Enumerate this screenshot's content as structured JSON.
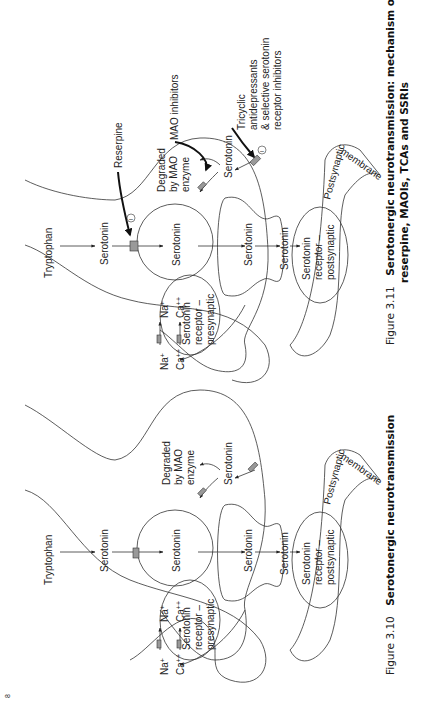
{
  "page": {
    "orientation": "rotated-90-ccw",
    "page_number_fragment": "8"
  },
  "figures": [
    {
      "id": "fig-3-10",
      "caption_number": "Figure 3.10",
      "caption_title": "Serotonergic neurotransmission",
      "labels": {
        "tryptophan": "Tryptophan",
        "serotonin_presynaptic": "Serotonin",
        "serotonin_vesicle": "Serotonin",
        "degraded_1": "Degraded",
        "degraded_2": "by MAO",
        "degraded_3": "enzyme",
        "serotonin_reuptake": "Serotonin",
        "serotonin_release": "Serotonin",
        "serotonin_cleft": "Serotonin",
        "na_out": "Na",
        "na_in": "Na",
        "ca_out": "Ca",
        "ca_in": "Ca",
        "na_charge": "+",
        "ca_charge": "++",
        "pre_receptor_1": "Serotonin",
        "pre_receptor_2": "receptor –",
        "pre_receptor_3": "presynaptic",
        "post_receptor_1": "Serotonin",
        "post_receptor_2": "receptor –",
        "post_receptor_3": "postsynaptic",
        "postsynaptic": "Postsynaptic",
        "membrane": "membrane"
      }
    },
    {
      "id": "fig-3-11",
      "caption_number": "Figure 3.11",
      "caption_title_line1": "Serotonergic neurotransmission: mechanism of action of",
      "caption_title_line2": "reserpine, MAOIs, TCAs and SSRIs",
      "labels": {
        "tryptophan": "Tryptophan",
        "serotonin_presynaptic": "Serotonin",
        "serotonin_vesicle": "Serotonin",
        "reserpine": "Reserpine",
        "mao_inhibitors": "MAO inhibitors",
        "degraded_1": "Degraded",
        "degraded_2": "by MAO",
        "degraded_3": "enzyme",
        "serotonin_reuptake": "Serotonin",
        "serotonin_release": "Serotonin",
        "serotonin_cleft": "Serotonin",
        "tca_1": "Tricyclic",
        "tca_2": "antidepressants",
        "tca_3": "& selective serotonin",
        "tca_4": "receptor inhibitors",
        "inhibit_symbol": "–",
        "na_out": "Na",
        "na_in": "Na",
        "ca_out": "Ca",
        "ca_in": "Ca",
        "na_charge": "+",
        "ca_charge": "++",
        "pre_receptor_1": "Serotonin",
        "pre_receptor_2": "receptor –",
        "pre_receptor_3": "presynaptic",
        "post_receptor_1": "Serotonin",
        "post_receptor_2": "receptor –",
        "post_receptor_3": "postsynaptic",
        "postsynaptic": "Postsynaptic",
        "membrane": "membrane"
      }
    }
  ]
}
